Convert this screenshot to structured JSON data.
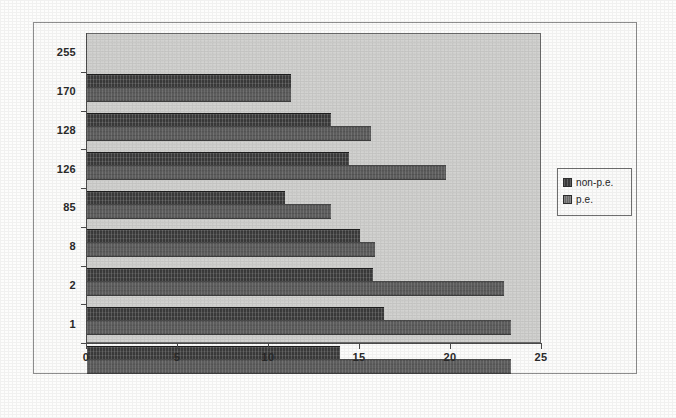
{
  "chart_data": {
    "type": "bar",
    "orientation": "horizontal",
    "title": "",
    "subtitle": "",
    "xlabel": "",
    "ylabel": "",
    "xlim": [
      0,
      25
    ],
    "ylim": null,
    "grid": false,
    "legend_position": "right",
    "xticks": [
      "0",
      "5",
      "10",
      "15",
      "20",
      "25"
    ],
    "xtick_values": [
      0,
      5,
      10,
      15,
      20,
      25
    ],
    "categories": [
      "255",
      "170",
      "128",
      "126",
      "85",
      "8",
      "2",
      "1"
    ],
    "series": [
      {
        "name": "non-p.e.",
        "color": "#3a3a3a",
        "values": [
          11.2,
          13.4,
          14.4,
          10.9,
          15.0,
          15.7,
          16.3,
          13.9
        ]
      },
      {
        "name": "p.e.",
        "color": "#6a6a6a",
        "values": [
          11.2,
          15.6,
          19.7,
          13.4,
          15.8,
          22.9,
          23.3,
          23.3
        ]
      }
    ]
  },
  "legend": {
    "entries": [
      {
        "label": "non-p.e."
      },
      {
        "label": "p.e."
      }
    ]
  },
  "colors": {
    "plot_background": "#d2d2d0",
    "page_background": "#fdfdfc",
    "axis": "#4a4a4a",
    "frame": "#8e8e8e",
    "series_non_pe": "#3a3a3a",
    "series_pe": "#6a6a6a"
  }
}
